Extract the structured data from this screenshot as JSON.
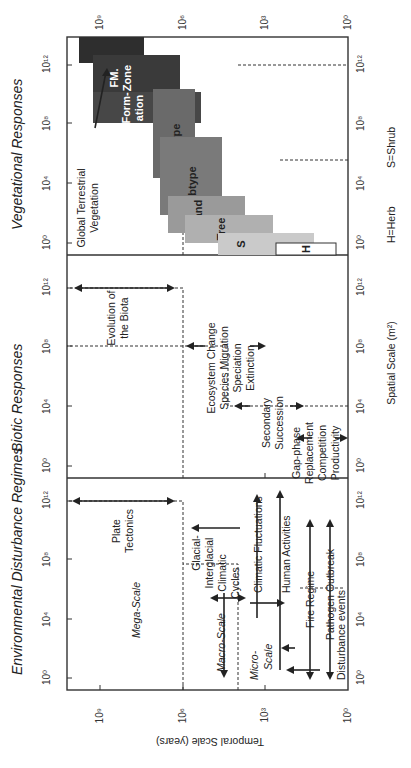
{
  "diagram": {
    "y_axis_label": "Temporal Scale (years)",
    "x_axis_label": "Spatial Scale (m²)",
    "temporal_ticks": [
      "10⁰",
      "10³",
      "10⁶",
      "10⁹"
    ],
    "spatial_ticks": [
      "10⁰",
      "10⁴",
      "10⁸",
      "10¹²"
    ],
    "legend": {
      "herb": "H=Herb",
      "shrub": "S=Shrub"
    },
    "panels": [
      {
        "title": "Environmental Disturbance Regimes",
        "scale_labels": {
          "mega": "Mega-Scale",
          "macro": "Macro-Scale",
          "micro1": "Micro-",
          "micro2": "Scale"
        },
        "processes": {
          "plate1": "Plate",
          "plate2": "Tectonics",
          "glacial1": "Glacial-",
          "glacial2": "Interglacial",
          "glacial3": "Climatic",
          "glacial4": "Cycles",
          "climatic": "Climatic Fluctuations",
          "human": "Human Activities",
          "fire": "Fire Regime",
          "pathogen": "Pathogen Outbreak",
          "disturbance": "Disturbance events"
        }
      },
      {
        "title": "Biotic Responses",
        "processes": {
          "evo1": "Evolution of",
          "evo2": "the Biota",
          "eco1": "Ecosystem Change",
          "eco2": "Species Migration",
          "eco3": "Speciation",
          "eco4": "Extinction",
          "sec1": "Secondary",
          "sec2": "Succession",
          "gap1": "Gap-phase",
          "gap2": "Replacement",
          "gap3": "Competition",
          "gap4": "Productivity"
        }
      },
      {
        "title": "Vegetational Responses",
        "global1": "Global Terrestrial",
        "global2": "Vegetation",
        "units": {
          "fmzone1": "FM.",
          "fmzone2": "Zone",
          "formation1": "Form-",
          "formation2": "ation",
          "type": "Type",
          "subtype": "Subtype",
          "stand": "Stand",
          "tree": "Tree",
          "shrub": "S",
          "herb": "H"
        },
        "colors": {
          "global": "#2e2e2e",
          "fmzone": "#3a3a3a",
          "formation": "#474747",
          "type": "#6a6a6a",
          "subtype": "#7a7a7a",
          "stand": "#9a9a9a",
          "tree": "#b0b0b0",
          "shrub": "#cacaca",
          "herb": "#ffffff"
        }
      }
    ]
  }
}
